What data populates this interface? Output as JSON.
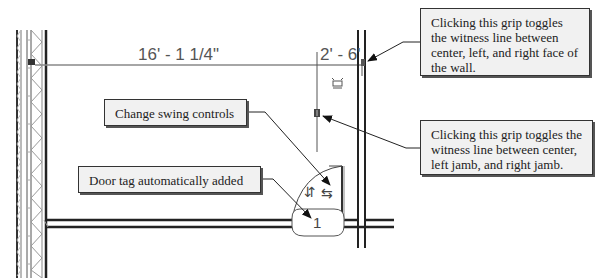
{
  "diagram": {
    "type": "floor-plan-annotation",
    "dimensions": {
      "primary": "16' - 1 1/4\"",
      "secondary": "2' - 6'"
    },
    "door_tag": {
      "number": "1"
    },
    "swing_controls": {
      "flip_vertical_glyph": "⇵",
      "flip_horizontal_glyph": "⇆"
    },
    "callouts": [
      {
        "id": "change-swing",
        "text": "Change swing controls"
      },
      {
        "id": "door-tag",
        "text": "Door tag automatically added"
      },
      {
        "id": "wall-grip",
        "text": "Clicking this grip toggles the witness line between center, left, and right face of the wall."
      },
      {
        "id": "jamb-grip",
        "text": "Clicking this grip toggles the witness line between center, left jamb, and right jamb."
      }
    ],
    "colors": {
      "line": "#333333",
      "dimension_line": "#777777",
      "callout_fill": "#f1f1f1",
      "callout_border": "#333333"
    }
  }
}
